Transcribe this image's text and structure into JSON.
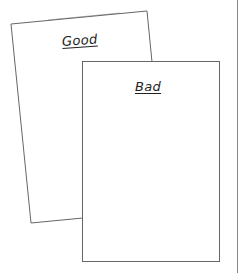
{
  "diagram": {
    "cards": [
      {
        "id": "good",
        "label": "Good",
        "rotated": true,
        "points": [
          [
            11,
            24
          ],
          [
            147,
            11
          ],
          [
            152,
            62
          ]
        ],
        "bottom_left": [
          31,
          223
        ],
        "hidden_behind": "bad"
      },
      {
        "id": "bad",
        "label": "Bad",
        "rotated": false,
        "rect": {
          "x": 82,
          "y": 61,
          "w": 138,
          "h": 201
        }
      }
    ],
    "page_edge": {
      "x": 237
    },
    "colors": {
      "stroke": "#666666",
      "text": "#222222",
      "background": "#ffffff"
    }
  }
}
